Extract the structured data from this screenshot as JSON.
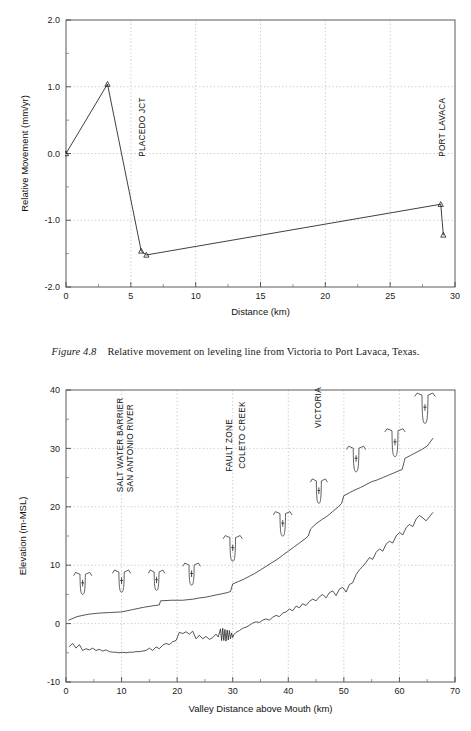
{
  "caption": {
    "label": "Figure 4.8",
    "text": "Relative movement on leveling line from Victoria to Port Lavaca, Texas."
  },
  "chart_data": [
    {
      "id": "relative-movement",
      "type": "line",
      "title": "",
      "xlabel": "Distance (km)",
      "ylabel": "Relative Movement (mm/yr)",
      "xlim": [
        0,
        30
      ],
      "ylim": [
        -2.0,
        2.0
      ],
      "xticks": [
        0,
        5,
        10,
        15,
        20,
        25,
        30
      ],
      "xticklabels": [
        "0",
        "5",
        "10",
        "15",
        "20",
        "25",
        "30"
      ],
      "yticks": [
        -2.0,
        -1.0,
        0.0,
        1.0,
        2.0
      ],
      "yticklabels": [
        "-2.0",
        "-1.0",
        "0.0",
        "1.0",
        "2.0"
      ],
      "grid": true,
      "legend": "none",
      "series": [
        {
          "name": "Relative movement",
          "marker": "triangle",
          "x": [
            0.0,
            3.2,
            5.8,
            6.2,
            28.9,
            29.1
          ],
          "y": [
            0.0,
            1.04,
            -1.46,
            -1.52,
            -0.76,
            -1.22
          ]
        }
      ],
      "annotations": [
        {
          "text": "PLACEDO JCT",
          "x": 5.8,
          "y": -0.05,
          "rotation": -90
        },
        {
          "text": "PORT LAVACA",
          "x": 28.9,
          "y": -0.05,
          "rotation": -90
        }
      ]
    },
    {
      "id": "valley-profile",
      "type": "line",
      "title": "",
      "xlabel": "Valley Distance above Mouth (km)",
      "ylabel": "Elevation (m-MSL)",
      "xlim": [
        0,
        70
      ],
      "ylim": [
        -10,
        40
      ],
      "xticks": [
        0,
        10,
        20,
        30,
        40,
        50,
        60,
        70
      ],
      "xticklabels": [
        "0",
        "10",
        "20",
        "30",
        "40",
        "50",
        "60",
        "70"
      ],
      "yticks": [
        -10,
        0,
        10,
        20,
        30,
        40
      ],
      "yticklabels": [
        "-10",
        "0",
        "10",
        "20",
        "30",
        "40"
      ],
      "grid": true,
      "legend": "none",
      "series": [
        {
          "name": "Valley surface (upper profile)",
          "marker": "none",
          "x": [
            0.5,
            2,
            4,
            6,
            8,
            10,
            12,
            14,
            16,
            16.8,
            17,
            19,
            20,
            21,
            22,
            23,
            24,
            25,
            26,
            27,
            28,
            29,
            29.6,
            30,
            31,
            32,
            33,
            34,
            35,
            36,
            37,
            38,
            39,
            40,
            41,
            42,
            43,
            43.6,
            44,
            45,
            46,
            47,
            48,
            49,
            49.6,
            50,
            51,
            52,
            53,
            54,
            55,
            56,
            57,
            58,
            59,
            60,
            60.5,
            61,
            62,
            63,
            64,
            65,
            66
          ],
          "y": [
            0.6,
            1.2,
            1.6,
            1.8,
            1.9,
            2.0,
            2.4,
            2.8,
            3.1,
            3.2,
            3.9,
            4.0,
            4.0,
            4.0,
            4.1,
            4.2,
            4.4,
            4.5,
            4.7,
            4.9,
            5.1,
            5.3,
            5.5,
            6.8,
            7.2,
            7.6,
            8.1,
            8.6,
            9.2,
            9.8,
            10.4,
            11.0,
            11.7,
            12.4,
            13.1,
            13.8,
            14.5,
            15.0,
            16.2,
            17.1,
            17.8,
            18.4,
            19.2,
            20.0,
            20.6,
            21.9,
            22.4,
            22.9,
            23.3,
            23.8,
            24.3,
            24.6,
            25.0,
            25.4,
            25.8,
            26.2,
            26.4,
            28.3,
            28.8,
            29.3,
            29.8,
            30.4,
            31.7
          ]
        },
        {
          "name": "Channel thalweg (lower profile)",
          "marker": "none",
          "x": [
            0.6,
            1.2,
            1.8,
            2.4,
            3,
            3.6,
            4.2,
            4.8,
            5.4,
            6,
            6.6,
            7.2,
            7.8,
            8.4,
            9,
            9.6,
            10.2,
            10.8,
            11.4,
            12,
            12.6,
            13.2,
            13.8,
            14.4,
            15,
            15.6,
            16.2,
            16.8,
            17.4,
            18,
            18.6,
            19.2,
            19.8,
            20.4,
            21,
            21.6,
            22.2,
            22.8,
            23.4,
            24,
            24.6,
            25.2,
            25.8,
            26.4,
            27,
            27.4,
            27.8,
            28,
            28.2,
            28.4,
            28.6,
            28.8,
            29,
            29.2,
            29.4,
            29.6,
            29.8,
            30,
            30.2,
            30.6,
            31.2,
            31.8,
            32.4,
            33,
            33.6,
            34.2,
            34.8,
            35.4,
            36,
            36.6,
            37.2,
            37.8,
            38.4,
            39,
            39.6,
            40.2,
            40.8,
            41.4,
            42,
            42.6,
            43.2,
            43.8,
            44.4,
            45,
            45.6,
            46.2,
            46.8,
            47.4,
            48,
            48.6,
            49.2,
            49.8,
            50.4,
            51,
            51.6,
            52.2,
            52.8,
            53.4,
            54,
            54.6,
            55.2,
            55.8,
            56.4,
            57,
            57.6,
            58.2,
            58.8,
            59.4,
            60,
            60.6,
            61.2,
            61.8,
            62.4,
            63,
            63.6,
            64.2,
            64.8,
            65.4,
            66
          ],
          "y": [
            -3.9,
            -3.4,
            -4.2,
            -3.6,
            -4.6,
            -4.3,
            -4.5,
            -4.2,
            -4.6,
            -4.4,
            -4.7,
            -4.5,
            -4.8,
            -4.9,
            -4.9,
            -5.0,
            -4.9,
            -5.0,
            -4.9,
            -4.9,
            -4.8,
            -4.8,
            -4.7,
            -4.6,
            -4.2,
            -4.6,
            -4.0,
            -4.3,
            -3.7,
            -3.4,
            -3.6,
            -3.1,
            -2.9,
            -1.5,
            -1.7,
            -1.4,
            -1.8,
            -1.3,
            -2.6,
            -2.0,
            -2.6,
            -2.2,
            -2.7,
            -2.4,
            -1.8,
            -2.3,
            -0.9,
            -2.9,
            -0.8,
            -2.9,
            -1.0,
            -3.0,
            -1.1,
            -2.8,
            -1.2,
            -2.6,
            -1.6,
            -2.4,
            -1.9,
            -1.5,
            -1.2,
            -0.8,
            -0.6,
            -0.3,
            0.1,
            0.3,
            0.2,
            0.6,
            0.8,
            0.6,
            1.1,
            1.4,
            1.2,
            1.8,
            2.0,
            2.5,
            2.2,
            3.0,
            2.7,
            3.4,
            3.1,
            3.8,
            4.2,
            3.9,
            4.6,
            5.0,
            4.4,
            5.3,
            5.6,
            4.8,
            5.9,
            6.2,
            5.4,
            6.7,
            7.0,
            8.4,
            9.2,
            9.8,
            10.5,
            11.3,
            11.0,
            12.2,
            12.8,
            12.4,
            13.6,
            14.1,
            13.8,
            15.0,
            15.6,
            15.2,
            16.4,
            17.0,
            16.6,
            17.9,
            18.5,
            18.1,
            17.6,
            18.3,
            19.0,
            18.6,
            19.6,
            20.3
          ]
        }
      ],
      "annotations": [
        {
          "text": "SALT WATER BARRIER",
          "x": 9.7,
          "y": 22.5,
          "rotation": -90
        },
        {
          "text": "SAN ANTONIO RIVER",
          "x": 11.6,
          "y": 22.5,
          "rotation": -90
        },
        {
          "text": "FAULT ZONE",
          "x": 29.3,
          "y": 26.0,
          "rotation": -90
        },
        {
          "text": "COLETO CREEK",
          "x": 31.7,
          "y": 26.5,
          "rotation": -90
        },
        {
          "text": "VICTORIA",
          "x": 45.3,
          "y": 33.5,
          "rotation": -90
        }
      ],
      "cross_sections": [
        {
          "x": 3.0,
          "y": 8.6,
          "w": 3.2,
          "d": 3.6
        },
        {
          "x": 10.0,
          "y": 9.0,
          "w": 3.2,
          "d": 3.6
        },
        {
          "x": 16.3,
          "y": 9.0,
          "w": 2.9,
          "d": 3.3
        },
        {
          "x": 22.6,
          "y": 10.2,
          "w": 3.1,
          "d": 3.6
        },
        {
          "x": 30.0,
          "y": 14.9,
          "w": 3.4,
          "d": 4.2
        },
        {
          "x": 39.0,
          "y": 19.0,
          "w": 3.3,
          "d": 4.0
        },
        {
          "x": 45.5,
          "y": 24.6,
          "w": 3.0,
          "d": 4.0
        },
        {
          "x": 52.2,
          "y": 30.2,
          "w": 3.4,
          "d": 4.2
        },
        {
          "x": 59.2,
          "y": 33.2,
          "w": 3.6,
          "d": 4.6
        },
        {
          "x": 64.6,
          "y": 39.3,
          "w": 3.6,
          "d": 5.0
        }
      ]
    }
  ]
}
